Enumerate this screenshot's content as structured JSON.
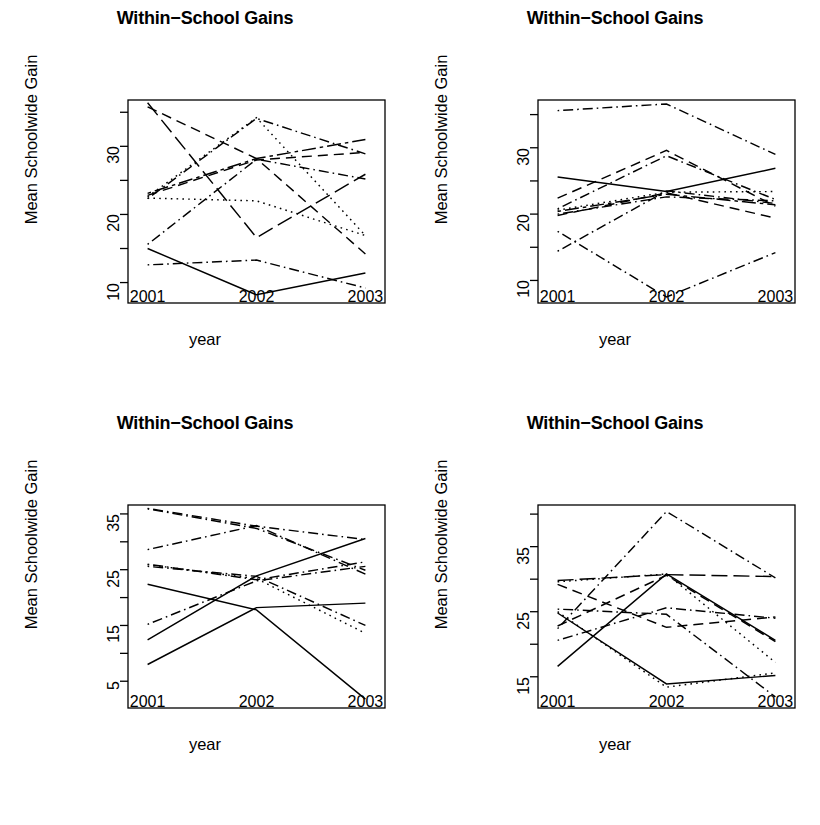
{
  "figure": {
    "width": 820,
    "height": 825,
    "background": "#ffffff",
    "ink": "#000000",
    "panel_count": 4,
    "layout": "2x2 grid of line charts"
  },
  "common": {
    "title": "Within−School Gains",
    "xlabel": "year",
    "ylabel": "Mean Schoolwide Gain",
    "xticklabels": [
      "2001",
      "2002",
      "2003"
    ],
    "x_values": [
      2001,
      2002,
      2003
    ]
  },
  "chart_data": [
    {
      "type": "line",
      "panel": "top-left",
      "title": "Within−School Gains",
      "xlabel": "year",
      "ylabel": "Mean Schoolwide Gain",
      "x": [
        2001,
        2002,
        2003
      ],
      "xticklabels": [
        "2001",
        "2002",
        "2003"
      ],
      "yticks": [
        10,
        15,
        20,
        25,
        30,
        35
      ],
      "yticklabels": [
        "10",
        "",
        "20",
        "",
        "30",
        ""
      ],
      "ylim": [
        7.0,
        36.8
      ],
      "xlim": [
        2000.82,
        2003.18
      ],
      "grid": false,
      "legend": "none",
      "series": [
        {
          "name": "school-1",
          "linetype": "solid",
          "values": [
            15.0,
            8.2,
            11.4
          ]
        },
        {
          "name": "school-2",
          "linetype": "dotdash",
          "values": [
            12.6,
            13.3,
            9.2
          ]
        },
        {
          "name": "school-3",
          "linetype": "dotted",
          "values": [
            22.4,
            22.0,
            16.9
          ]
        },
        {
          "name": "school-4",
          "linetype": "dotdash",
          "values": [
            15.6,
            28.1,
            25.2
          ]
        },
        {
          "name": "school-5",
          "linetype": "longdash",
          "values": [
            36.4,
            16.6,
            25.9
          ]
        },
        {
          "name": "school-6",
          "linetype": "dashed",
          "values": [
            35.8,
            28.2,
            14.2
          ]
        },
        {
          "name": "school-7",
          "linetype": "dotted",
          "values": [
            22.6,
            34.2,
            16.9
          ]
        },
        {
          "name": "school-8",
          "linetype": "dotdash",
          "values": [
            22.3,
            34.1,
            28.9
          ]
        },
        {
          "name": "school-9",
          "linetype": "twodash",
          "values": [
            23.1,
            28.2,
            31.0
          ]
        },
        {
          "name": "school-10",
          "linetype": "dashed",
          "values": [
            22.8,
            28.0,
            29.1
          ]
        }
      ]
    },
    {
      "type": "line",
      "panel": "top-right",
      "title": "Within−School Gains",
      "xlabel": "year",
      "ylabel": "Mean Schoolwide Gain",
      "x": [
        2001,
        2002,
        2003
      ],
      "xticklabels": [
        "2001",
        "2002",
        "2003"
      ],
      "yticks": [
        10,
        15,
        20,
        25,
        30,
        35
      ],
      "yticklabels": [
        "10",
        "",
        "20",
        "",
        "30",
        ""
      ],
      "ylim": [
        6.6,
        37.2
      ],
      "xlim": [
        2000.82,
        2003.18
      ],
      "grid": false,
      "legend": "none",
      "series": [
        {
          "name": "school-1",
          "linetype": "dotdash",
          "values": [
            35.6,
            36.6,
            29.0
          ]
        },
        {
          "name": "school-2",
          "linetype": "solid",
          "values": [
            25.6,
            23.4,
            26.9
          ]
        },
        {
          "name": "school-3",
          "linetype": "dashed",
          "values": [
            22.4,
            29.6,
            21.2
          ]
        },
        {
          "name": "school-4",
          "linetype": "dotdash",
          "values": [
            20.8,
            28.8,
            22.2
          ]
        },
        {
          "name": "school-5",
          "linetype": "dotted",
          "values": [
            20.6,
            23.3,
            23.4
          ]
        },
        {
          "name": "school-6",
          "linetype": "dashed",
          "values": [
            19.8,
            23.2,
            19.4
          ]
        },
        {
          "name": "school-7",
          "linetype": "dotdash",
          "values": [
            20.0,
            22.6,
            22.0
          ]
        },
        {
          "name": "school-8",
          "linetype": "twodash",
          "values": [
            20.4,
            23.0,
            21.4
          ]
        },
        {
          "name": "school-9",
          "linetype": "dotdash",
          "values": [
            17.4,
            7.5,
            14.2
          ]
        },
        {
          "name": "school-10",
          "linetype": "dotdash",
          "values": [
            14.4,
            23.5,
            21.6
          ]
        }
      ]
    },
    {
      "type": "line",
      "panel": "bottom-left",
      "title": "Within−School Gains",
      "xlabel": "year",
      "ylabel": "Mean Schoolwide Gain",
      "x": [
        2001,
        2002,
        2003
      ],
      "xticklabels": [
        "2001",
        "2002",
        "2003"
      ],
      "yticks": [
        5,
        10,
        15,
        20,
        25,
        30,
        35
      ],
      "yticklabels": [
        "5",
        "",
        "15",
        "",
        "25",
        "",
        "35"
      ],
      "ylim": [
        0.2,
        36.6
      ],
      "xlim": [
        2000.82,
        2003.18
      ],
      "grid": false,
      "legend": "none",
      "series": [
        {
          "name": "school-1",
          "linetype": "solid",
          "values": [
            22.4,
            17.8,
            1.8
          ]
        },
        {
          "name": "school-2",
          "linetype": "solid",
          "values": [
            12.4,
            23.9,
            30.6
          ]
        },
        {
          "name": "school-3",
          "linetype": "solid",
          "values": [
            8.0,
            18.2,
            19.0
          ]
        },
        {
          "name": "school-4",
          "linetype": "dotdash",
          "values": [
            36.0,
            32.8,
            30.4
          ]
        },
        {
          "name": "school-5",
          "linetype": "dotdash",
          "values": [
            28.6,
            32.9,
            24.2
          ]
        },
        {
          "name": "school-6",
          "linetype": "dotdash",
          "values": [
            26.0,
            23.2,
            26.4
          ]
        },
        {
          "name": "school-7",
          "linetype": "dotdash",
          "values": [
            15.2,
            23.0,
            25.6
          ]
        },
        {
          "name": "school-8",
          "linetype": "dotted",
          "values": [
            25.9,
            23.4,
            13.6
          ]
        },
        {
          "name": "school-9",
          "linetype": "dotdash",
          "values": [
            25.6,
            23.8,
            15.0
          ]
        },
        {
          "name": "school-10",
          "linetype": "dotdash",
          "values": [
            35.9,
            32.4,
            24.9
          ]
        }
      ]
    },
    {
      "type": "line",
      "panel": "bottom-right",
      "title": "Within−School Gains",
      "xlabel": "year",
      "ylabel": "Mean Schoolwide Gain",
      "x": [
        2001,
        2002,
        2003
      ],
      "xticklabels": [
        "2001",
        "2002",
        "2003"
      ],
      "yticks": [
        15,
        20,
        25,
        30,
        35,
        40
      ],
      "yticklabels": [
        "15",
        "",
        "25",
        "",
        "35",
        ""
      ],
      "ylim": [
        10.2,
        41.4
      ],
      "xlim": [
        2000.82,
        2003.18
      ],
      "grid": false,
      "legend": "none",
      "series": [
        {
          "name": "school-1",
          "linetype": "solid",
          "values": [
            16.6,
            30.8,
            20.6
          ]
        },
        {
          "name": "school-2",
          "linetype": "solid",
          "values": [
            24.8,
            13.9,
            15.2
          ]
        },
        {
          "name": "school-3",
          "linetype": "dotdash",
          "values": [
            22.4,
            40.4,
            30.2
          ]
        },
        {
          "name": "school-4",
          "linetype": "dotted",
          "values": [
            29.6,
            30.8,
            17.2
          ]
        },
        {
          "name": "school-5",
          "linetype": "dotted",
          "values": [
            25.0,
            13.4,
            15.6
          ]
        },
        {
          "name": "school-6",
          "linetype": "dotdash",
          "values": [
            20.6,
            25.6,
            24.0
          ]
        },
        {
          "name": "school-7",
          "linetype": "dotdash",
          "values": [
            25.4,
            24.6,
            11.9
          ]
        },
        {
          "name": "school-8",
          "linetype": "dashed",
          "values": [
            29.2,
            22.6,
            24.2
          ]
        },
        {
          "name": "school-9",
          "linetype": "dashed",
          "values": [
            22.8,
            30.6,
            20.4
          ]
        },
        {
          "name": "school-10",
          "linetype": "longdash",
          "values": [
            29.8,
            30.7,
            30.4
          ]
        }
      ]
    }
  ]
}
